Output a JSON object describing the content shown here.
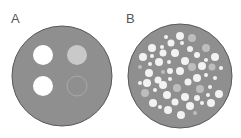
{
  "panels": [
    {
      "label": "A",
      "label_pos": [
        11,
        12
      ],
      "circle": {
        "cx": 62,
        "cy": 76,
        "r": 50,
        "fill": "#8f8f8f",
        "stroke": "#5a5a5a"
      },
      "dots": [
        {
          "cx": 43,
          "cy": 55,
          "r": 10,
          "fill": "#ffffff"
        },
        {
          "cx": 77,
          "cy": 55,
          "r": 10,
          "fill": "#c9c9c9"
        },
        {
          "cx": 43,
          "cy": 86,
          "r": 10,
          "fill": "#ffffff"
        },
        {
          "cx": 77,
          "cy": 86,
          "r": 10,
          "fill": "none",
          "stroke": "#a9a9a9"
        }
      ]
    },
    {
      "label": "B",
      "label_pos": [
        126,
        12
      ],
      "circle": {
        "cx": 180,
        "cy": 76,
        "r": 52,
        "fill": "#8f8f8f",
        "stroke": "#5a5a5a"
      },
      "dots": [
        {
          "cx": 180,
          "cy": 36,
          "r": 4,
          "fill": "#f2f2f2"
        },
        {
          "cx": 192,
          "cy": 38,
          "r": 4,
          "fill": "#bdbdbd"
        },
        {
          "cx": 166,
          "cy": 37,
          "r": 2,
          "fill": "#f2f2f2"
        },
        {
          "cx": 171,
          "cy": 43,
          "r": 3.5,
          "fill": "#f2f2f2"
        },
        {
          "cx": 182,
          "cy": 43,
          "r": 2,
          "fill": "#f2f2f2"
        },
        {
          "cx": 152,
          "cy": 48,
          "r": 4,
          "fill": "#f2f2f2"
        },
        {
          "cx": 162,
          "cy": 47,
          "r": 2,
          "fill": "#f2f2f2"
        },
        {
          "cx": 206,
          "cy": 48,
          "r": 4,
          "fill": "#bdbdbd"
        },
        {
          "cx": 190,
          "cy": 49,
          "r": 3,
          "fill": "#f2f2f2"
        },
        {
          "cx": 143,
          "cy": 57,
          "r": 4,
          "fill": "#f2f2f2"
        },
        {
          "cx": 163,
          "cy": 53,
          "r": 3.5,
          "fill": "#f2f2f2"
        },
        {
          "cx": 175,
          "cy": 53,
          "r": 4,
          "fill": "#f2f2f2"
        },
        {
          "cx": 197,
          "cy": 55,
          "r": 3,
          "fill": "#f2f2f2"
        },
        {
          "cx": 215,
          "cy": 57,
          "r": 4,
          "fill": "#f2f2f2"
        },
        {
          "cx": 152,
          "cy": 56,
          "r": 2,
          "fill": "#f2f2f2"
        },
        {
          "cx": 185,
          "cy": 61,
          "r": 4,
          "fill": "#f2f2f2"
        },
        {
          "cx": 159,
          "cy": 62,
          "r": 4,
          "fill": "#f2f2f2"
        },
        {
          "cx": 169,
          "cy": 62,
          "r": 2,
          "fill": "#f2f2f2"
        },
        {
          "cx": 206,
          "cy": 60,
          "r": 2,
          "fill": "#f2f2f2"
        },
        {
          "cx": 150,
          "cy": 64,
          "r": 2,
          "fill": "#f2f2f2"
        },
        {
          "cx": 192,
          "cy": 67,
          "r": 4,
          "fill": "#bdbdbd"
        },
        {
          "cx": 202,
          "cy": 66,
          "r": 4,
          "fill": "#f2f2f2"
        },
        {
          "cx": 212,
          "cy": 67,
          "r": 3.5,
          "fill": "#bdbdbd"
        },
        {
          "cx": 140,
          "cy": 67,
          "r": 2,
          "fill": "#bdbdbd"
        },
        {
          "cx": 221,
          "cy": 68,
          "r": 2,
          "fill": "#f2f2f2"
        },
        {
          "cx": 149,
          "cy": 73,
          "r": 4,
          "fill": "#f2f2f2"
        },
        {
          "cx": 163,
          "cy": 72,
          "r": 2,
          "fill": "#bdbdbd"
        },
        {
          "cx": 170,
          "cy": 71,
          "r": 3,
          "fill": "#f2f2f2"
        },
        {
          "cx": 180,
          "cy": 71,
          "r": 4,
          "fill": "#f2f2f2"
        },
        {
          "cx": 197,
          "cy": 78,
          "r": 4,
          "fill": "#f2f2f2"
        },
        {
          "cx": 206,
          "cy": 75,
          "r": 2,
          "fill": "#f2f2f2"
        },
        {
          "cx": 188,
          "cy": 82,
          "r": 3.5,
          "fill": "#f2f2f2"
        },
        {
          "cx": 158,
          "cy": 80,
          "r": 3.5,
          "fill": "#f2f2f2"
        },
        {
          "cx": 147,
          "cy": 83,
          "r": 4,
          "fill": "#f2f2f2"
        },
        {
          "cx": 170,
          "cy": 79,
          "r": 2,
          "fill": "#f2f2f2"
        },
        {
          "cx": 215,
          "cy": 78,
          "r": 2,
          "fill": "#f2f2f2"
        },
        {
          "cx": 177,
          "cy": 88,
          "r": 4,
          "fill": "#bdbdbd"
        },
        {
          "cx": 200,
          "cy": 89,
          "r": 4,
          "fill": "#bdbdbd"
        },
        {
          "cx": 145,
          "cy": 93,
          "r": 4,
          "fill": "#bdbdbd"
        },
        {
          "cx": 163,
          "cy": 85,
          "r": 4,
          "fill": "#f2f2f2"
        },
        {
          "cx": 219,
          "cy": 94,
          "r": 4,
          "fill": "#f2f2f2"
        },
        {
          "cx": 210,
          "cy": 87,
          "r": 2,
          "fill": "#f2f2f2"
        },
        {
          "cx": 140,
          "cy": 83,
          "r": 2,
          "fill": "#f2f2f2"
        },
        {
          "cx": 155,
          "cy": 90,
          "r": 2,
          "fill": "#f2f2f2"
        },
        {
          "cx": 167,
          "cy": 95,
          "r": 4,
          "fill": "#f2f2f2"
        },
        {
          "cx": 185,
          "cy": 97,
          "r": 4,
          "fill": "#f2f2f2"
        },
        {
          "cx": 197,
          "cy": 98,
          "r": 3,
          "fill": "#f2f2f2"
        },
        {
          "cx": 208,
          "cy": 95,
          "r": 2,
          "fill": "#f2f2f2"
        },
        {
          "cx": 153,
          "cy": 103,
          "r": 4,
          "fill": "#f2f2f2"
        },
        {
          "cx": 175,
          "cy": 102,
          "r": 3.5,
          "fill": "#f2f2f2"
        },
        {
          "cx": 190,
          "cy": 106,
          "r": 4,
          "fill": "#f2f2f2"
        },
        {
          "cx": 211,
          "cy": 103,
          "r": 4,
          "fill": "#f2f2f2"
        },
        {
          "cx": 168,
          "cy": 110,
          "r": 4,
          "fill": "#f2f2f2"
        },
        {
          "cx": 181,
          "cy": 115,
          "r": 4,
          "fill": "#f2f2f2"
        },
        {
          "cx": 160,
          "cy": 107,
          "r": 2,
          "fill": "#f2f2f2"
        },
        {
          "cx": 195,
          "cy": 113,
          "r": 2,
          "fill": "#bdbdbd"
        },
        {
          "cx": 202,
          "cy": 103,
          "r": 2,
          "fill": "#f2f2f2"
        }
      ]
    }
  ]
}
